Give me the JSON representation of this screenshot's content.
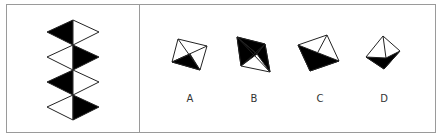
{
  "puzzle": {
    "question_panel": {
      "description": "Vertical stack of four diamonds, each split vertically into black and white halves",
      "diamonds": [
        {
          "index": 1,
          "black_half": "left"
        },
        {
          "index": 2,
          "black_half": "right"
        },
        {
          "index": 3,
          "black_half": "left"
        },
        {
          "index": 4,
          "black_half": "right"
        }
      ]
    },
    "options": [
      {
        "label": "A"
      },
      {
        "label": "B"
      },
      {
        "label": "C"
      },
      {
        "label": "D"
      }
    ],
    "colors": {
      "fill_dark": "#000000",
      "fill_light": "#ffffff",
      "stroke": "#222222",
      "border": "#9a9a9a"
    }
  }
}
